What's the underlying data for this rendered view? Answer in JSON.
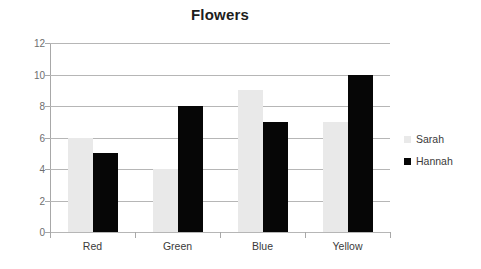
{
  "chart_data": {
    "type": "bar",
    "title": "Flowers",
    "categories": [
      "Red",
      "Green",
      "Blue",
      "Yellow"
    ],
    "series": [
      {
        "name": "Sarah",
        "values": [
          6,
          4,
          9,
          7
        ],
        "color": "#e9e9e9"
      },
      {
        "name": "Hannah",
        "values": [
          5,
          8,
          7,
          10
        ],
        "color": "#060606"
      }
    ],
    "xlabel": "",
    "ylabel": "",
    "ylim": [
      0,
      12
    ],
    "ytick_step": 2,
    "yticks": [
      0,
      2,
      4,
      6,
      8,
      10,
      12
    ],
    "ytick_labels": [
      "0",
      "2",
      "4",
      "6",
      "8",
      "10",
      "12"
    ],
    "grid": true,
    "grid_axis": "y",
    "legend": true,
    "legend_position": "right",
    "background": "#ffffff"
  }
}
